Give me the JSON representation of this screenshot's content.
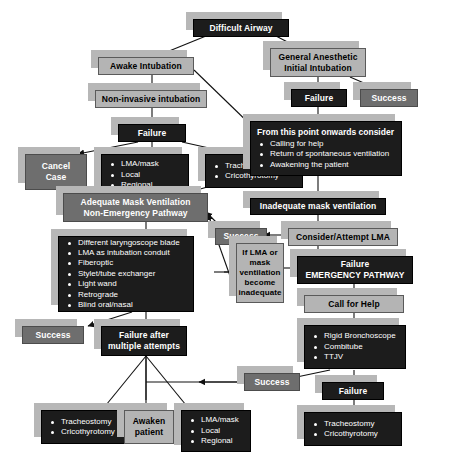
{
  "colors": {
    "dark": "#1c1c1c",
    "mid": "#6e6e6e",
    "light": "#b4b4b4",
    "pale": "#c9c9c9",
    "shadow": "#b7b7b7",
    "background": "#ffffff"
  },
  "nodes": {
    "difficult_airway": {
      "label": "Difficult Airway"
    },
    "awake_intubation": {
      "label": "Awake Intubation"
    },
    "non_invasive": {
      "label": "Non-invasive intubation"
    },
    "failure_awake": {
      "label": "Failure"
    },
    "cancel_case": {
      "line1": "Cancel",
      "line2": "Case"
    },
    "lma_local_regional_1": {
      "items": [
        "LMA/mask",
        "Local",
        "Regional"
      ]
    },
    "trach_crico_1": {
      "items": [
        "Tracheostomy",
        "Cricothyrotomy"
      ]
    },
    "general_anesthetic": {
      "line1": "General Anesthetic",
      "line2": "Initial Intubation"
    },
    "failure_ga": {
      "label": "Failure"
    },
    "success_ga": {
      "label": "Success"
    },
    "from_this_point": {
      "heading": "From this point onwards consider",
      "items": [
        "Calling for help",
        "Return of spontaneous ventilation",
        "Awakening the patient"
      ]
    },
    "adequate_mask": {
      "line1": "Adequate Mask Ventilation",
      "line2": "Non-Emergency Pathway"
    },
    "inadequate_mask": {
      "label": "Inadequate mask ventilation"
    },
    "success_nonemergency": {
      "label": "Success"
    },
    "consider_lma": {
      "label": "Consider/Attempt LMA"
    },
    "options_list": {
      "items": [
        "Different laryngoscope blade",
        "LMA as intubation conduit",
        "Fiberoptic",
        "Stylet/tube exchanger",
        "Light wand",
        "Retrograde",
        "Blind oral/nasal"
      ]
    },
    "if_lma_or_mask": {
      "lines": [
        "If LMA or",
        "mask",
        "ventilation",
        "become",
        "inadequate"
      ]
    },
    "failure_emergency": {
      "line1": "Failure",
      "line2": "EMERGENCY PATHWAY"
    },
    "call_for_help": {
      "label": "Call for Help"
    },
    "success_options": {
      "label": "Success"
    },
    "failure_multiple": {
      "line1": "Failure after",
      "line2": "multiple attempts"
    },
    "rigid_list": {
      "items": [
        "Rigid Bronchoscope",
        "Combitube",
        "TTJV"
      ]
    },
    "success_emergency": {
      "label": "Success"
    },
    "failure_emergency_final": {
      "label": "Failure"
    },
    "trach_crico_2": {
      "items": [
        "Tracheostomy",
        "Cricothyrotomy"
      ]
    },
    "awaken_patient": {
      "line1": "Awaken",
      "line2": "patient"
    },
    "lma_local_regional_2": {
      "items": [
        "LMA/mask",
        "Local",
        "Regional"
      ]
    },
    "trach_crico_3": {
      "items": [
        "Tracheostomy",
        "Cricothyrotomy"
      ]
    }
  }
}
